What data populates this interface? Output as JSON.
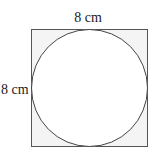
{
  "diagram": {
    "shape": "circle inscribed in square",
    "top_label": "8 cm",
    "left_label": "8 cm",
    "colors": {
      "stroke": "#555555",
      "corner_fill": "#f4f4f4",
      "circle_fill": "#ffffff",
      "text": "#222222"
    }
  }
}
